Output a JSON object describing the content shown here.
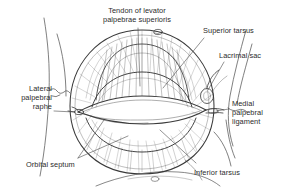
{
  "figure": {
    "ink_color": "#3a3a3a",
    "text_color": "#2b2b2b",
    "background_color": "#ffffff",
    "leader_color": "#4a4a4a"
  },
  "labels": {
    "tendon_levator": "Tendon of levator\npalpebrae superioris",
    "superior_tarsus": "Superior tarsus",
    "lacrimal_sac": "Lacrimal sac",
    "medial_palpebral_ligament": "Medial\npalpebral\nligament",
    "inferior_tarsus": "Inferior tarsus",
    "orbital_septum": "Orbital septum",
    "lateral_palpebral_raphe": "Lateral\npalpebral\nraphe"
  }
}
